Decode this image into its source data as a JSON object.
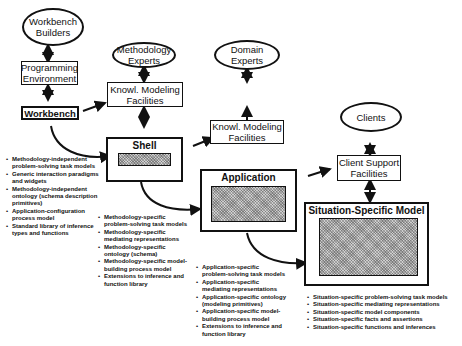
{
  "diagram": {
    "roles": {
      "workbench_builders": "Workbench Builders",
      "methodology_experts": "Methodology Experts",
      "domain_experts": "Domain Experts",
      "clients": "Clients"
    },
    "facilities": {
      "programming_environment": "Programming Environment",
      "workbench": "Workbench",
      "knowl_modeling_facilities_1": "Knowl. Modeling Facilities",
      "knowl_modeling_facilities_2": "Knowl. Modeling Facilities",
      "client_support_facilities": "Client Support Facilities"
    },
    "stages": {
      "shell": "Shell",
      "application": "Application",
      "situation_specific_model": "Situation-Specific Model"
    },
    "lists": {
      "shell_contents": [
        "Methodology-independent problem-solving task models",
        "Generic interaction paradigms and widgets",
        "Methodology-independent ontology (schema description primitives)",
        "Application-configuration process model",
        "Standard library of inference types and functions"
      ],
      "methodology_contents": [
        "Methodology-specific problem-solving task models",
        "Methodology-specific mediating representations",
        "Methodology-specific ontology (schema)",
        "Methodology-specific model-building process model",
        "Extensions to inference and function library"
      ],
      "application_contents": [
        "Application-specific problem-solving task models",
        "Application-specific mediating representations",
        "Application-specific ontology (modeling primitives)",
        "Application-specific model-building process model",
        "Extensions to inference and function library"
      ],
      "situation_contents": [
        "Situation-specific problem-solving task models",
        "Situation-specific mediating representations",
        "Situation-specific model components",
        "Situation-specific facts and assertions",
        "Situation-specific functions and inferences"
      ]
    }
  }
}
